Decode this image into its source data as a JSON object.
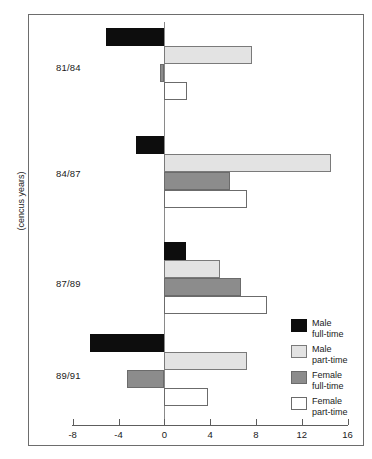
{
  "chart_data": {
    "type": "bar",
    "orientation": "horizontal",
    "title": "",
    "xlabel": "",
    "ylabel": "(cencus years)",
    "categories": [
      "81/84",
      "84/87",
      "87/89",
      "89/91"
    ],
    "series": [
      {
        "name": "Male full-time",
        "short": "Male",
        "line2": "full-time",
        "color": "#0d0d0d",
        "values": [
          -5.1,
          -2.5,
          1.9,
          -6.5
        ]
      },
      {
        "name": "Male part-time",
        "short": "Male",
        "line2": "part-time",
        "color": "#e3e3e3",
        "values": [
          7.7,
          14.6,
          4.9,
          7.2
        ]
      },
      {
        "name": "Female full-time",
        "short": "Female",
        "line2": "full-time",
        "color": "#8c8c8c",
        "values": [
          -0.4,
          5.7,
          6.7,
          -3.3
        ]
      },
      {
        "name": "Female part-time",
        "short": "Female",
        "line2": "part-time",
        "color": "#ffffff",
        "values": [
          2.0,
          7.2,
          9.0,
          3.8
        ]
      }
    ],
    "xticks": [
      -8,
      -4,
      0,
      4,
      8,
      12,
      16
    ],
    "xtick_labels": [
      "-8",
      "-4",
      "0",
      "4",
      "8",
      "12",
      "16"
    ],
    "xlim": [
      -8,
      16
    ],
    "grid": false,
    "legend_position": "right-bottom",
    "zero_line": true
  },
  "axis": {
    "y_title": "(cencus years)"
  },
  "legend": {
    "items": [
      {
        "label_line1": "Male",
        "label_line2": "full-time"
      },
      {
        "label_line1": "Male",
        "label_line2": "part-time"
      },
      {
        "label_line1": "Female",
        "label_line2": "full-time"
      },
      {
        "label_line1": "Female",
        "label_line2": "part-time"
      }
    ]
  }
}
